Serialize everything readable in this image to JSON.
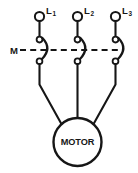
{
  "diagram": {
    "type": "electrical-schematic",
    "background_color": "#ffffff",
    "line_color": "#161616",
    "coil_label": "M",
    "motor_label": "MOTOR",
    "lines": [
      {
        "id": "L1",
        "base": "L",
        "subscript": "1"
      },
      {
        "id": "L2",
        "base": "L",
        "subscript": "2"
      },
      {
        "id": "L3",
        "base": "L",
        "subscript": "3"
      }
    ],
    "contacts": [
      {
        "pole": "1",
        "type": "normally-open",
        "state": "open"
      },
      {
        "pole": "2",
        "type": "normally-open",
        "state": "open"
      },
      {
        "pole": "3",
        "type": "normally-open",
        "state": "open"
      }
    ],
    "mechanical_link": "dashed",
    "load": {
      "name": "MOTOR",
      "shape": "circle",
      "connections": 3
    }
  }
}
